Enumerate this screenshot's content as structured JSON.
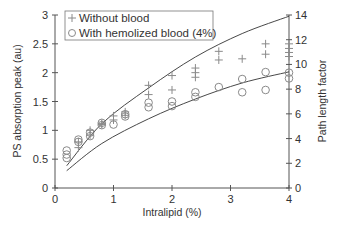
{
  "chart_data": {
    "type": "scatter",
    "title": "",
    "xlabel": "Intralipid (%)",
    "ylabel": "PS absorption peak (au)",
    "y2label": "Path length factor",
    "xlim": [
      0,
      4
    ],
    "ylim": [
      0,
      3
    ],
    "y2lim": [
      0,
      14
    ],
    "x_ticks": [
      "0",
      "1",
      "2",
      "3",
      "4"
    ],
    "y_ticks": [
      "0",
      "0.5",
      "1",
      "1.5",
      "2",
      "2.5",
      "3"
    ],
    "y2_ticks": [
      "0",
      "2",
      "4",
      "6",
      "8",
      "10",
      "12",
      "14"
    ],
    "grid": false,
    "legend_position": "top-left",
    "series": [
      {
        "name": "Without blood",
        "marker": "plus",
        "axis": "left",
        "points": [
          [
            0.4,
            0.8
          ],
          [
            0.4,
            0.7
          ],
          [
            0.6,
            1.0
          ],
          [
            0.6,
            0.92
          ],
          [
            0.8,
            1.12
          ],
          [
            0.8,
            1.1
          ],
          [
            1.0,
            1.25
          ],
          [
            1.0,
            1.18
          ],
          [
            1.2,
            1.32
          ],
          [
            1.2,
            1.26
          ],
          [
            1.6,
            1.78
          ],
          [
            1.6,
            1.62
          ],
          [
            2.0,
            1.95
          ],
          [
            2.0,
            1.7
          ],
          [
            2.4,
            2.08
          ],
          [
            2.4,
            2.0
          ],
          [
            2.4,
            1.92
          ],
          [
            2.8,
            2.37
          ],
          [
            2.8,
            2.22
          ],
          [
            3.2,
            2.24
          ],
          [
            3.6,
            2.5
          ],
          [
            3.6,
            2.32
          ],
          [
            4.0,
            2.5
          ],
          [
            4.0,
            2.42
          ],
          [
            4.0,
            2.35
          ],
          [
            4.0,
            2.28
          ]
        ]
      },
      {
        "name": "With hemolized blood (4%)",
        "marker": "circle",
        "axis": "left",
        "points": [
          [
            0.2,
            0.65
          ],
          [
            0.2,
            0.58
          ],
          [
            0.2,
            0.52
          ],
          [
            0.4,
            0.84
          ],
          [
            0.4,
            0.8
          ],
          [
            0.6,
            0.96
          ],
          [
            0.6,
            0.9
          ],
          [
            0.8,
            1.13
          ],
          [
            0.8,
            1.09
          ],
          [
            1.0,
            1.1
          ],
          [
            1.2,
            1.28
          ],
          [
            1.2,
            1.24
          ],
          [
            1.6,
            1.48
          ],
          [
            1.6,
            1.4
          ],
          [
            2.0,
            1.5
          ],
          [
            2.0,
            1.42
          ],
          [
            2.4,
            1.66
          ],
          [
            2.4,
            1.58
          ],
          [
            2.8,
            1.75
          ],
          [
            3.2,
            1.89
          ],
          [
            3.2,
            1.66
          ],
          [
            3.6,
            2.01
          ],
          [
            3.6,
            1.7
          ],
          [
            4.0,
            2.0
          ],
          [
            4.0,
            1.9
          ]
        ]
      },
      {
        "name": "Path length factor (without blood)",
        "marker": "line",
        "axis": "right",
        "points": [
          [
            0.2,
            1.8
          ],
          [
            0.8,
            5.2
          ],
          [
            1.6,
            8.1
          ],
          [
            2.4,
            10.6
          ],
          [
            3.2,
            12.5
          ],
          [
            4.0,
            13.9
          ]
        ]
      },
      {
        "name": "Path length factor (with blood)",
        "marker": "line",
        "axis": "right",
        "points": [
          [
            0.2,
            1.4
          ],
          [
            0.8,
            3.6
          ],
          [
            1.6,
            5.6
          ],
          [
            2.4,
            7.2
          ],
          [
            3.2,
            8.5
          ],
          [
            4.0,
            9.4
          ]
        ]
      }
    ],
    "legend": [
      {
        "label": "Without blood",
        "marker": "plus"
      },
      {
        "label": "With hemolized blood (4%)",
        "marker": "circle"
      }
    ],
    "colors": {
      "axis": "#555555",
      "marker": "#8a8a8a",
      "line": "#333333",
      "text": "#333333"
    }
  }
}
